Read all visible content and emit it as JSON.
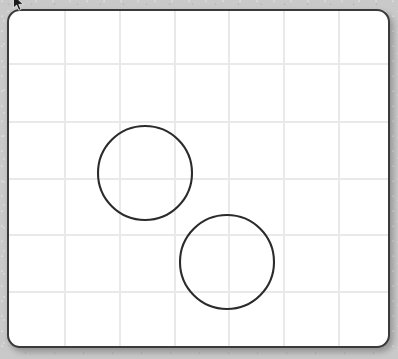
{
  "app": {
    "title": "Whiteboard Canvas",
    "background_color": "#c9c9c9"
  },
  "board": {
    "name": "drawing-canvas",
    "background_color": "#ffffff",
    "border_color": "#3a3a3a",
    "border_width_px": 2,
    "corner_radius_px": 13,
    "x": 7,
    "y": 9,
    "width": 383,
    "height": 339
  },
  "grid": {
    "color": "#e9e9e9",
    "line_width_px": 1.4,
    "spacing_px": 55,
    "vertical_lines_x": [
      56,
      111,
      166,
      220,
      275,
      330
    ],
    "horizontal_lines_y": [
      53,
      111,
      168,
      224,
      281
    ]
  },
  "shapes": [
    {
      "name": "circle-upper-left",
      "type": "circle",
      "stroke_color": "#2b2b2b",
      "stroke_width_px": 2.1,
      "fill": "none",
      "center_x": 136,
      "center_y": 162,
      "radius": 47,
      "diameter": 94
    },
    {
      "name": "circle-lower-right",
      "type": "circle",
      "stroke_color": "#2b2b2b",
      "stroke_width_px": 2.1,
      "fill": "none",
      "center_x": 218,
      "center_y": 251,
      "radius": 47,
      "diameter": 94
    }
  ],
  "cursor": {
    "name": "mouse-pointer",
    "color": "#1a1a1a",
    "x": 13,
    "y": -5
  }
}
